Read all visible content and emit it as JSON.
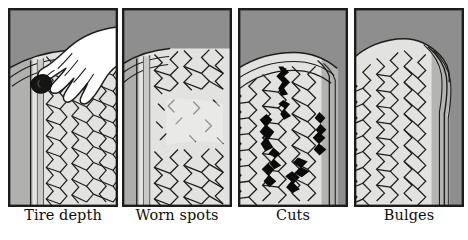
{
  "figure": {
    "title_partial": "",
    "background_color": "#ffffff",
    "panel_background": "#8e8e8e",
    "tread_color": "#e2e2e0",
    "sidewall_color": "#b8b8b6",
    "line_color": "#1c1c1c",
    "damage_color": "#0a0a0a",
    "skin_color": "#ffffff"
  },
  "panels": [
    {
      "id": "tire-depth",
      "caption": "Tire depth",
      "icon": "hand-with-coin-in-tread-icon",
      "description": "Hand inserting a coin into the tire tread groove to measure depth"
    },
    {
      "id": "worn-spots",
      "caption": "Worn spots",
      "icon": "worn-tread-icon",
      "description": "Tire tread with faded and broken pattern indicating worn spots"
    },
    {
      "id": "cuts",
      "caption": "Cuts",
      "icon": "tread-cuts-icon",
      "description": "Tire with dark jagged cuts across the tread and sidewall"
    },
    {
      "id": "bulges",
      "caption": "Bulges",
      "icon": "sidewall-bulge-icon",
      "description": "Tire sidewall distorted outward showing a bulge"
    }
  ]
}
